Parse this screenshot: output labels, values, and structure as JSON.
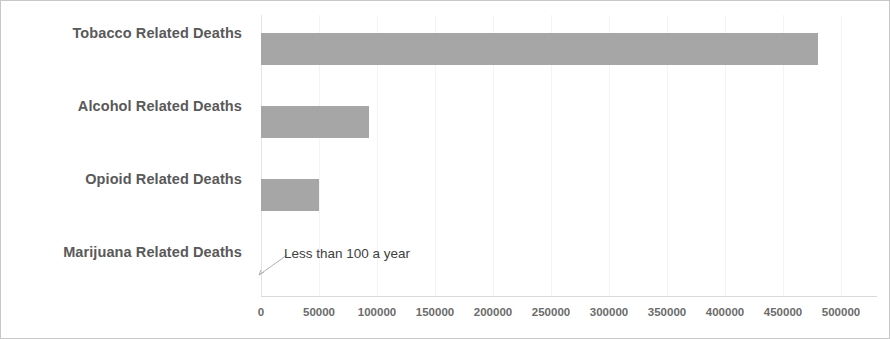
{
  "chart_data": {
    "type": "bar",
    "orientation": "horizontal",
    "title": "",
    "xlabel": "",
    "ylabel": "",
    "categories": [
      "Tobacco Related Deaths",
      "Alcohol Related Deaths",
      "Opioid Related Deaths",
      "Marijuana Related Deaths"
    ],
    "values": [
      480000,
      93000,
      50000,
      0
    ],
    "xlim": [
      0,
      500000
    ],
    "xticks": [
      0,
      50000,
      100000,
      150000,
      200000,
      250000,
      300000,
      350000,
      400000,
      450000,
      500000
    ],
    "xtick_labels": [
      "0",
      "50000",
      "100000",
      "150000",
      "200000",
      "250000",
      "300000",
      "350000",
      "400000",
      "450000",
      "500000"
    ],
    "grid": true,
    "legend": false,
    "bar_color": "#a6a6a6",
    "annotations": [
      {
        "text": "Less than 100 a year",
        "target_category": "Marijuana Related Deaths",
        "target_value": 0
      }
    ]
  },
  "style": {
    "border_color": "#c8c8c8",
    "label_color": "#595959",
    "tick_color": "#6b6b6b",
    "gridline_color": "#f4f4f4",
    "axis_color": "#d9d9d9",
    "annotation_color": "#404040"
  }
}
